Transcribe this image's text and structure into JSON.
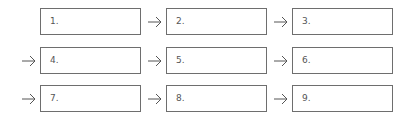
{
  "diagram": {
    "boxes": [
      {
        "label": "1."
      },
      {
        "label": "2."
      },
      {
        "label": "3."
      },
      {
        "label": "4."
      },
      {
        "label": "5."
      },
      {
        "label": "6."
      },
      {
        "label": "7."
      },
      {
        "label": "8."
      },
      {
        "label": "9."
      }
    ],
    "arrow_icon": "right-arrow-icon",
    "colors": {
      "border": "#6e6e6e",
      "text": "#555555",
      "arrow": "#555555"
    }
  }
}
